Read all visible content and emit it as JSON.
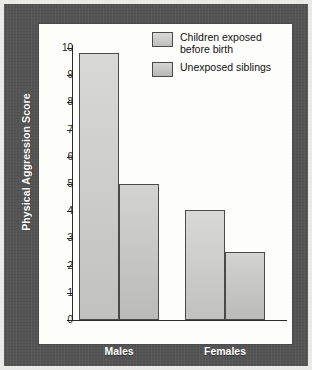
{
  "chart_data": {
    "type": "bar",
    "title": "",
    "xlabel": "",
    "ylabel": "Physical Aggression Score",
    "ylim": [
      0,
      10
    ],
    "yticks": [
      10,
      9,
      8,
      7,
      6,
      5,
      4,
      3,
      2,
      1,
      0
    ],
    "grid": false,
    "legend_position": "top-right",
    "categories": [
      "Males",
      "Females"
    ],
    "series": [
      {
        "name": "Children exposed before birth",
        "values": [
          9.8,
          4.05
        ],
        "color": "#c9c9c7"
      },
      {
        "name": "Unexposed siblings",
        "values": [
          5.0,
          2.5
        ],
        "color": "#c2c2c0"
      }
    ]
  },
  "legend": {
    "items": [
      {
        "label_line1": "Children exposed",
        "label_line2": "before birth"
      },
      {
        "label_line1": "Unexposed siblings",
        "label_line2": ""
      }
    ]
  },
  "axis": {
    "y_title": "Physical Aggression Score"
  },
  "colors": {
    "frame": "#545454",
    "panel": "#fdfdfb",
    "bar_series_a": "#c9c9c7",
    "bar_series_b": "#c2c2c0",
    "axis": "#2b2b2b",
    "label_text": "#ffffff"
  }
}
